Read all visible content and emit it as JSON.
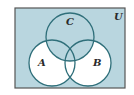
{
  "diagram": {
    "type": "venn",
    "universe_label": "U",
    "sets": [
      {
        "name": "A",
        "label": "A"
      },
      {
        "name": "B",
        "label": "B"
      },
      {
        "name": "C",
        "label": "C"
      }
    ],
    "shaded_region": "C ∪ (A ∪ B)'",
    "colors": {
      "shade": "#b9d6df",
      "unshaded": "#ffffff",
      "circle_stroke": "#2f6f7a",
      "frame_stroke": "#555555"
    }
  }
}
